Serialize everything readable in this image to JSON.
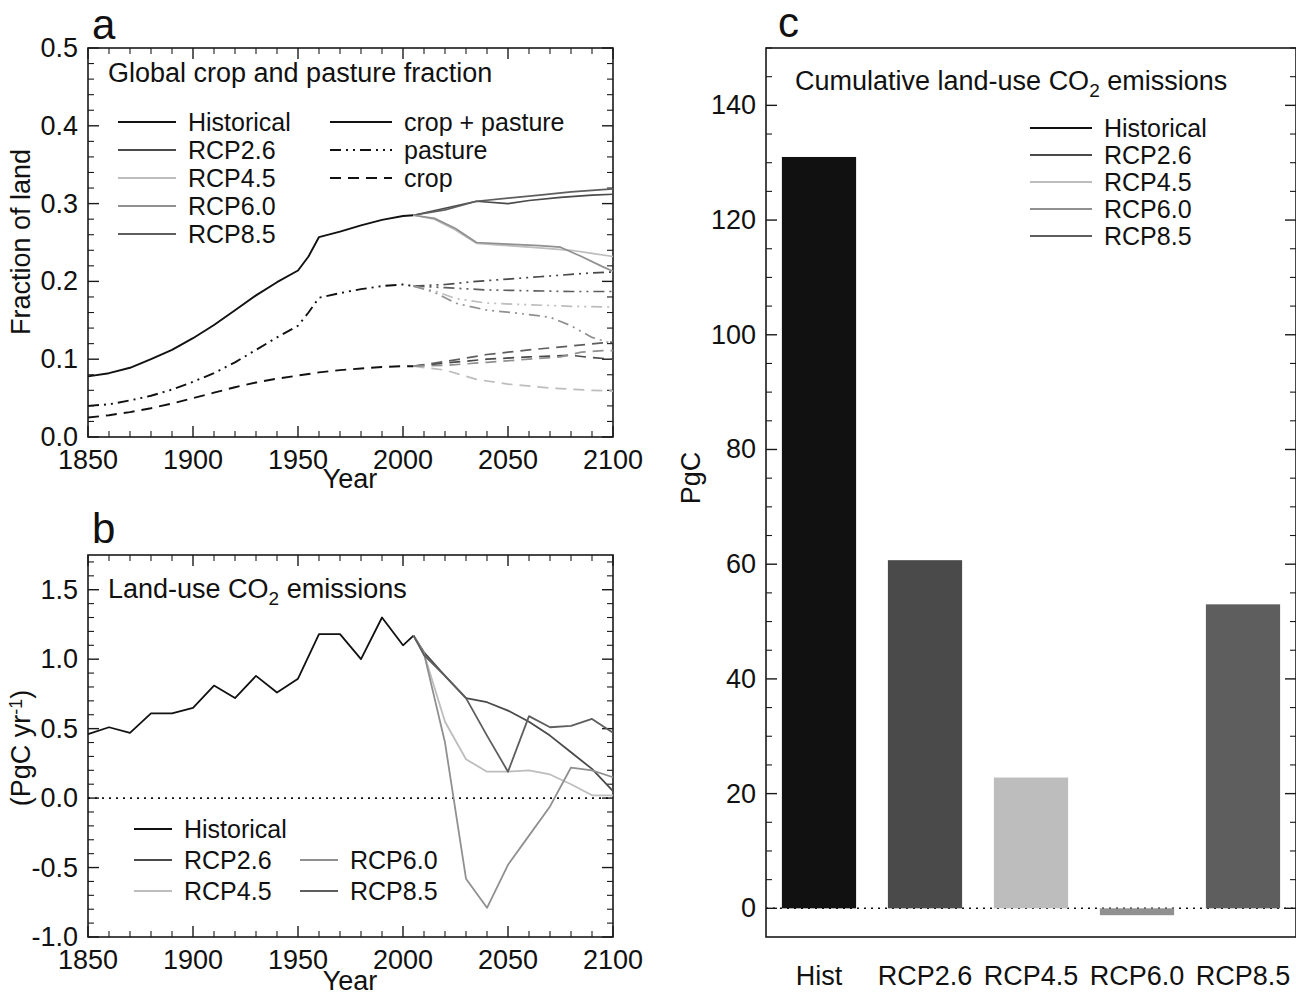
{
  "figure": {
    "panels": [
      {
        "id": "a",
        "letter": "a"
      },
      {
        "id": "b",
        "letter": "b"
      },
      {
        "id": "c",
        "letter": "c"
      }
    ]
  },
  "panel_a": {
    "letter": "a",
    "title": "Global crop and pasture fraction",
    "xlabel": "Year",
    "ylabel": "Fraction of land",
    "xticks": [
      "1850",
      "1900",
      "1950",
      "2000",
      "2050",
      "2100"
    ],
    "yticks": [
      "0.0",
      "0.1",
      "0.2",
      "0.3",
      "0.4",
      "0.5"
    ],
    "legend_scenarios": [
      "Historical",
      "RCP2.6",
      "RCP4.5",
      "RCP6.0",
      "RCP8.5"
    ],
    "legend_styles": [
      "crop + pasture",
      "pasture",
      "crop"
    ]
  },
  "panel_b": {
    "letter": "b",
    "title_parts": {
      "pre": "Land-use CO",
      "sub": "2",
      "post": " emissions"
    },
    "title": "Land-use CO2 emissions",
    "xlabel": "Year",
    "ylabel_parts": {
      "pre": "(PgC yr",
      "sup": "-1",
      "post": ")"
    },
    "ylabel": "(PgC yr-1)",
    "xticks": [
      "1850",
      "1900",
      "1950",
      "2000",
      "2050",
      "2100"
    ],
    "yticks": [
      "-1.0",
      "-0.5",
      "0.0",
      "0.5",
      "1.0",
      "1.5"
    ],
    "legend_col1": [
      "Historical",
      "RCP2.6",
      "RCP4.5"
    ],
    "legend_col2": [
      "RCP6.0",
      "RCP8.5"
    ]
  },
  "panel_c": {
    "letter": "c",
    "title_parts": {
      "pre": "Cumulative land-use CO",
      "sub": "2",
      "post": " emissions"
    },
    "title": "Cumulative land-use CO2 emissions",
    "ylabel": "PgC",
    "yticks": [
      "0",
      "20",
      "40",
      "60",
      "80",
      "100",
      "120",
      "140"
    ],
    "categories": [
      "Hist",
      "RCP2.6",
      "RCP4.5",
      "RCP6.0",
      "RCP8.5"
    ],
    "legend_scenarios": [
      "Historical",
      "RCP2.6",
      "RCP4.5",
      "RCP6.0",
      "RCP8.5"
    ]
  },
  "colors": {
    "historical": "#111111",
    "rcp26": "#4a4a4a",
    "rcp45": "#bdbdbd",
    "rcp60": "#909090",
    "rcp85": "#5e5e5e",
    "axis": "#1a1a1a",
    "background": "#ffffff"
  },
  "chart_data": [
    {
      "panel": "a",
      "type": "line",
      "title": "Global crop and pasture fraction",
      "xlabel": "Year",
      "ylabel": "Fraction of land",
      "xlim": [
        1850,
        2100
      ],
      "ylim": [
        0.0,
        0.5
      ],
      "grid": false,
      "legend_position": "upper-left",
      "line_style_legend": [
        "crop + pasture (solid)",
        "pasture (dash-dot-dot)",
        "crop (dashed)"
      ],
      "series": [
        {
          "name": "Historical crop + pasture",
          "scenario": "Historical",
          "variable": "crop + pasture",
          "style": "solid",
          "color": "#111111",
          "x": [
            1850,
            1860,
            1870,
            1880,
            1890,
            1900,
            1910,
            1920,
            1930,
            1940,
            1950,
            1955,
            1960,
            1970,
            1980,
            1990,
            2000,
            2005
          ],
          "values": [
            0.078,
            0.082,
            0.089,
            0.1,
            0.112,
            0.127,
            0.144,
            0.163,
            0.182,
            0.199,
            0.214,
            0.232,
            0.257,
            0.264,
            0.272,
            0.279,
            0.284,
            0.285
          ]
        },
        {
          "name": "Historical pasture",
          "scenario": "Historical",
          "variable": "pasture",
          "style": "dashdotdot",
          "color": "#111111",
          "x": [
            1850,
            1860,
            1870,
            1880,
            1890,
            1900,
            1910,
            1920,
            1930,
            1940,
            1950,
            1955,
            1960,
            1970,
            1980,
            1990,
            2000,
            2005
          ],
          "values": [
            0.04,
            0.042,
            0.047,
            0.053,
            0.061,
            0.071,
            0.082,
            0.096,
            0.112,
            0.128,
            0.143,
            0.16,
            0.179,
            0.185,
            0.19,
            0.194,
            0.196,
            0.194
          ]
        },
        {
          "name": "Historical crop",
          "scenario": "Historical",
          "variable": "crop",
          "style": "dashed",
          "color": "#111111",
          "x": [
            1850,
            1860,
            1870,
            1880,
            1890,
            1900,
            1910,
            1920,
            1930,
            1940,
            1950,
            1960,
            1970,
            1980,
            1990,
            2000,
            2005
          ],
          "values": [
            0.025,
            0.028,
            0.032,
            0.037,
            0.043,
            0.05,
            0.057,
            0.064,
            0.07,
            0.075,
            0.079,
            0.083,
            0.086,
            0.088,
            0.09,
            0.091,
            0.091
          ]
        },
        {
          "name": "RCP2.6 crop + pasture",
          "scenario": "RCP2.6",
          "variable": "crop + pasture",
          "style": "solid",
          "color": "#4a4a4a",
          "x": [
            2005,
            2020,
            2035,
            2050,
            2060,
            2075,
            2090,
            2100
          ],
          "values": [
            0.285,
            0.294,
            0.303,
            0.3,
            0.304,
            0.308,
            0.311,
            0.312
          ]
        },
        {
          "name": "RCP2.6 pasture",
          "scenario": "RCP2.6",
          "variable": "pasture",
          "style": "dashdotdot",
          "color": "#4a4a4a",
          "x": [
            2005,
            2020,
            2035,
            2050,
            2065,
            2080,
            2090,
            2100
          ],
          "values": [
            0.194,
            0.196,
            0.2,
            0.203,
            0.206,
            0.209,
            0.211,
            0.212
          ]
        },
        {
          "name": "RCP2.6 crop",
          "scenario": "RCP2.6",
          "variable": "crop",
          "style": "dashed",
          "color": "#4a4a4a",
          "x": [
            2005,
            2020,
            2040,
            2060,
            2080,
            2090,
            2100
          ],
          "values": [
            0.091,
            0.095,
            0.1,
            0.103,
            0.105,
            0.102,
            0.1
          ]
        },
        {
          "name": "RCP8.5 crop + pasture",
          "scenario": "RCP8.5",
          "variable": "crop + pasture",
          "style": "solid",
          "color": "#5e5e5e",
          "x": [
            2005,
            2020,
            2035,
            2050,
            2065,
            2080,
            2095,
            2100
          ],
          "values": [
            0.285,
            0.292,
            0.303,
            0.307,
            0.311,
            0.315,
            0.318,
            0.319
          ]
        },
        {
          "name": "RCP8.5 pasture",
          "scenario": "RCP8.5",
          "variable": "pasture",
          "style": "dashdotdot",
          "color": "#5e5e5e",
          "x": [
            2005,
            2020,
            2040,
            2060,
            2080,
            2100
          ],
          "values": [
            0.194,
            0.192,
            0.189,
            0.188,
            0.187,
            0.187
          ]
        },
        {
          "name": "RCP8.5 crop",
          "scenario": "RCP8.5",
          "variable": "crop",
          "style": "dashed",
          "color": "#5e5e5e",
          "x": [
            2005,
            2020,
            2040,
            2060,
            2080,
            2095,
            2100
          ],
          "values": [
            0.091,
            0.097,
            0.106,
            0.112,
            0.117,
            0.121,
            0.122
          ]
        },
        {
          "name": "RCP4.5 crop + pasture",
          "scenario": "RCP4.5",
          "variable": "crop + pasture",
          "style": "solid",
          "color": "#bdbdbd",
          "x": [
            2005,
            2015,
            2025,
            2035,
            2050,
            2065,
            2080,
            2090,
            2100
          ],
          "values": [
            0.285,
            0.28,
            0.266,
            0.249,
            0.246,
            0.243,
            0.24,
            0.236,
            0.232
          ]
        },
        {
          "name": "RCP4.5 pasture",
          "scenario": "RCP4.5",
          "variable": "pasture",
          "style": "dashdotdot",
          "color": "#bdbdbd",
          "x": [
            2005,
            2015,
            2025,
            2040,
            2060,
            2080,
            2100
          ],
          "values": [
            0.194,
            0.188,
            0.178,
            0.172,
            0.17,
            0.168,
            0.167
          ]
        },
        {
          "name": "RCP4.5 crop",
          "scenario": "RCP4.5",
          "variable": "crop",
          "style": "dashed",
          "color": "#bdbdbd",
          "x": [
            2005,
            2020,
            2035,
            2050,
            2070,
            2090,
            2100
          ],
          "values": [
            0.091,
            0.086,
            0.074,
            0.068,
            0.063,
            0.06,
            0.059
          ]
        },
        {
          "name": "RCP6.0 crop + pasture",
          "scenario": "RCP6.0",
          "variable": "crop + pasture",
          "style": "solid",
          "color": "#909090",
          "x": [
            2005,
            2015,
            2025,
            2035,
            2050,
            2065,
            2075,
            2085,
            2095,
            2100
          ],
          "values": [
            0.285,
            0.281,
            0.268,
            0.25,
            0.248,
            0.246,
            0.244,
            0.232,
            0.219,
            0.213
          ]
        },
        {
          "name": "RCP6.0 pasture",
          "scenario": "RCP6.0",
          "variable": "pasture",
          "style": "dashdotdot",
          "color": "#909090",
          "x": [
            2005,
            2015,
            2025,
            2040,
            2055,
            2070,
            2080,
            2090,
            2100
          ],
          "values": [
            0.194,
            0.186,
            0.172,
            0.163,
            0.159,
            0.154,
            0.143,
            0.128,
            0.12
          ]
        },
        {
          "name": "RCP6.0 crop",
          "scenario": "RCP6.0",
          "variable": "crop",
          "style": "dashed",
          "color": "#909090",
          "x": [
            2005,
            2020,
            2040,
            2060,
            2075,
            2085,
            2095,
            2100
          ],
          "values": [
            0.091,
            0.092,
            0.096,
            0.1,
            0.103,
            0.109,
            0.111,
            0.111
          ]
        }
      ]
    },
    {
      "panel": "b",
      "type": "line",
      "title": "Land-use CO2 emissions",
      "xlabel": "Year",
      "ylabel": "(PgC yr-1)",
      "xlim": [
        1850,
        2100
      ],
      "ylim": [
        -1.0,
        1.75
      ],
      "grid": false,
      "zero_line": true,
      "legend_position": "lower-left",
      "series": [
        {
          "name": "Historical",
          "color": "#111111",
          "x": [
            1850,
            1860,
            1870,
            1880,
            1890,
            1900,
            1910,
            1920,
            1930,
            1940,
            1950,
            1960,
            1970,
            1980,
            1990,
            2000,
            2005
          ],
          "values": [
            0.46,
            0.51,
            0.47,
            0.61,
            0.61,
            0.65,
            0.81,
            0.72,
            0.88,
            0.76,
            0.86,
            1.18,
            1.18,
            1.0,
            1.3,
            1.1,
            1.17
          ]
        },
        {
          "name": "RCP2.6",
          "color": "#4a4a4a",
          "x": [
            2005,
            2010,
            2020,
            2030,
            2040,
            2050,
            2060,
            2070,
            2080,
            2090,
            2100
          ],
          "values": [
            1.17,
            1.05,
            0.88,
            0.72,
            0.69,
            0.63,
            0.55,
            0.45,
            0.33,
            0.21,
            0.05
          ]
        },
        {
          "name": "RCP4.5",
          "color": "#bdbdbd",
          "x": [
            2005,
            2010,
            2020,
            2030,
            2040,
            2050,
            2060,
            2070,
            2080,
            2090,
            2100
          ],
          "values": [
            1.17,
            1.04,
            0.55,
            0.28,
            0.19,
            0.19,
            0.2,
            0.17,
            0.1,
            0.02,
            0.02
          ]
        },
        {
          "name": "RCP6.0",
          "color": "#909090",
          "x": [
            2005,
            2010,
            2020,
            2030,
            2040,
            2050,
            2060,
            2070,
            2080,
            2090,
            2100
          ],
          "values": [
            1.17,
            1.04,
            0.4,
            -0.58,
            -0.79,
            -0.48,
            -0.27,
            -0.06,
            0.22,
            0.2,
            0.15
          ]
        },
        {
          "name": "RCP8.5",
          "color": "#5e5e5e",
          "x": [
            2005,
            2010,
            2020,
            2030,
            2040,
            2050,
            2060,
            2070,
            2080,
            2090,
            2100
          ],
          "values": [
            1.17,
            1.03,
            0.88,
            0.72,
            0.45,
            0.19,
            0.59,
            0.51,
            0.52,
            0.57,
            0.47
          ]
        }
      ]
    },
    {
      "panel": "c",
      "type": "bar",
      "title": "Cumulative land-use CO2 emissions",
      "xlabel": "",
      "ylabel": "PgC",
      "categories": [
        "Hist",
        "RCP2.6",
        "RCP4.5",
        "RCP6.0",
        "RCP8.5"
      ],
      "values": [
        131,
        60.7,
        22.8,
        -1.2,
        53
      ],
      "ylim": [
        -5,
        150
      ],
      "yticks": [
        0,
        20,
        40,
        60,
        80,
        100,
        120,
        140
      ],
      "grid": false,
      "legend_position": "upper-right",
      "bar_colors": [
        "#111111",
        "#4a4a4a",
        "#bdbdbd",
        "#909090",
        "#5e5e5e"
      ]
    }
  ]
}
